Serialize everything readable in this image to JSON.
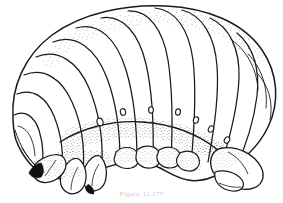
{
  "figure": {
    "kind": "scientific-line-illustration",
    "background_color": "#ffffff",
    "ink_color": "#1a1a1a",
    "stipple_color": "#3a3a3a",
    "claw_fill_color": "#111111",
    "caption_color": "#c9c9c9",
    "caption": {
      "visible": true,
      "legible": false,
      "number_text": "Figure",
      "text": "11.177"
    },
    "anatomy": {
      "body_outline_label": "larva-body-outline",
      "dorsal_segment_count": 12,
      "spiracle_count": 8,
      "leg_count": 3,
      "head_capsule": "anterior head capsule at right",
      "anal_region": "posterior abdominal segments at left"
    }
  }
}
